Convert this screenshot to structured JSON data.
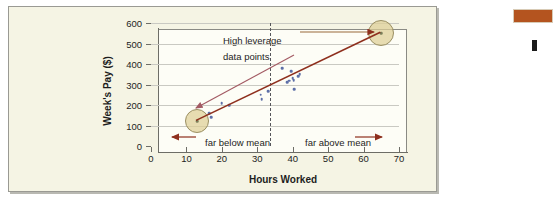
{
  "figure": {
    "background_color": "#f5f4e4",
    "border_color": "#9a9a93"
  },
  "margin": {
    "rule_color": "#b4541f",
    "mark_color": "#1b1b1b"
  },
  "chart_data": {
    "type": "scatter",
    "title": "",
    "xlabel": "Hours Worked",
    "ylabel": "Week's Pay ($)",
    "xlim": [
      0,
      70
    ],
    "ylim": [
      0,
      600
    ],
    "xticks": [
      0,
      10,
      20,
      30,
      40,
      50,
      60,
      70
    ],
    "yticks": [
      0,
      100,
      200,
      300,
      400,
      500,
      600
    ],
    "grid": "horizontal",
    "legend": "none",
    "points": [
      {
        "x": 13,
        "y": 120,
        "leverage": "high"
      },
      {
        "x": 16.5,
        "y": 160
      },
      {
        "x": 17,
        "y": 140
      },
      {
        "x": 20,
        "y": 208
      },
      {
        "x": 22,
        "y": 200
      },
      {
        "x": 31,
        "y": 250
      },
      {
        "x": 31.2,
        "y": 228
      },
      {
        "x": 33,
        "y": 268
      },
      {
        "x": 37,
        "y": 380
      },
      {
        "x": 38.5,
        "y": 312
      },
      {
        "x": 39,
        "y": 318
      },
      {
        "x": 39.5,
        "y": 365
      },
      {
        "x": 40,
        "y": 330
      },
      {
        "x": 40.3,
        "y": 322
      },
      {
        "x": 40.5,
        "y": 278
      },
      {
        "x": 41.5,
        "y": 340
      },
      {
        "x": 42,
        "y": 350
      },
      {
        "x": 65,
        "y": 550,
        "leverage": "high"
      }
    ],
    "regression_line": {
      "color": "#8e2f1d",
      "x_start": 13,
      "y_start": 120,
      "x_end": 65,
      "y_end": 550
    },
    "mean_line": {
      "x": 33.5,
      "style": "dashed",
      "color": "#55555a"
    },
    "highlight_circles": [
      {
        "x": 13,
        "y": 120,
        "radius_px": 11,
        "fill": "#decE96"
      },
      {
        "x": 65,
        "y": 550,
        "radius_px": 12,
        "fill": "#decE96"
      }
    ],
    "annotations": [
      {
        "id": "high-leverage",
        "line1": "High leverage",
        "line2": "data points"
      },
      {
        "id": "far-below-mean",
        "text": "far below mean",
        "arrow": "left"
      },
      {
        "id": "far-above-mean",
        "text": "far above mean",
        "arrow": "right"
      }
    ]
  }
}
